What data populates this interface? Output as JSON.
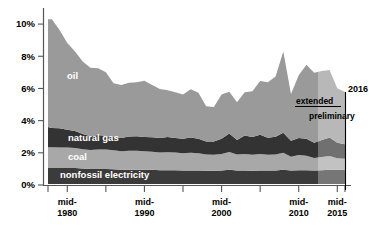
{
  "chart_data": {
    "type": "area",
    "stacked": true,
    "title": "",
    "subtitle": "",
    "xlabel": "",
    "ylabel": "",
    "grid": false,
    "legend_position": "inline-on-areas",
    "xlim": [
      1977.5,
      2016.0
    ],
    "ylim": [
      0,
      11.0
    ],
    "ytick_labels": [
      "0%",
      "2%",
      "4%",
      "6%",
      "8%",
      "10%"
    ],
    "ytick_values": [
      0,
      2,
      4,
      6,
      8,
      10
    ],
    "xtick_labels": [
      "mid-\n1980",
      "mid-\n1990",
      "mid-\n2000",
      "mid-\n2010",
      "mid-\n2015"
    ],
    "xtick_label_lines": [
      {
        "top": "mid-",
        "bottom": "1980",
        "value": 1980
      },
      {
        "top": "mid-",
        "bottom": "1990",
        "value": 1990
      },
      {
        "top": "mid-",
        "bottom": "2000",
        "value": 2000
      },
      {
        "top": "mid-",
        "bottom": "2010",
        "value": 2010
      },
      {
        "top": "mid-",
        "bottom": "2015",
        "value": 2015
      }
    ],
    "xtick_minor_values": [
      1977.5,
      1985,
      1995,
      2005,
      2016
    ],
    "x": [
      1977.5,
      1978,
      1979,
      1980,
      1981,
      1982,
      1983,
      1984,
      1985,
      1986,
      1987,
      1988,
      1989,
      1990,
      1991,
      1992,
      1993,
      1994,
      1995,
      1996,
      1997,
      1998,
      1999,
      2000,
      2001,
      2002,
      2003,
      2004,
      2005,
      2006,
      2007,
      2008,
      2009,
      2010,
      2011,
      2012,
      2013,
      2014,
      2015,
      2016
    ],
    "series": [
      {
        "name": "nonfossil electricity",
        "label": "nonfossil electricity",
        "color": "#3b3b3b",
        "values": [
          1.05,
          1.05,
          1.05,
          1.05,
          1.05,
          1.02,
          1.0,
          1.0,
          1.0,
          0.98,
          0.95,
          0.95,
          0.95,
          0.95,
          0.95,
          0.92,
          0.92,
          0.92,
          0.9,
          0.9,
          0.9,
          0.88,
          0.88,
          0.9,
          0.95,
          0.9,
          0.9,
          0.88,
          0.9,
          0.9,
          0.9,
          0.95,
          0.9,
          0.92,
          0.92,
          0.9,
          0.92,
          0.95,
          0.95,
          0.95
        ]
      },
      {
        "name": "coal",
        "label": "coal",
        "color": "#a8a8a8",
        "values": [
          1.3,
          1.3,
          1.28,
          1.28,
          1.25,
          1.2,
          1.18,
          1.2,
          1.2,
          1.18,
          1.15,
          1.18,
          1.18,
          1.15,
          1.12,
          1.1,
          1.12,
          1.1,
          1.08,
          1.1,
          1.08,
          1.02,
          1.0,
          1.02,
          1.1,
          1.0,
          1.02,
          1.0,
          1.02,
          0.98,
          1.0,
          1.05,
          0.85,
          0.95,
          0.9,
          0.78,
          0.82,
          0.85,
          0.72,
          0.68
        ]
      },
      {
        "name": "natural gas",
        "label": "natural gas",
        "color": "#333333",
        "values": [
          1.25,
          1.2,
          1.2,
          1.1,
          1.05,
          0.95,
          0.85,
          0.9,
          0.85,
          0.82,
          0.82,
          0.88,
          0.9,
          0.88,
          0.9,
          0.9,
          0.95,
          0.9,
          0.9,
          0.95,
          0.9,
          0.8,
          0.82,
          0.95,
          1.15,
          0.9,
          1.15,
          1.1,
          1.2,
          1.05,
          1.1,
          1.25,
          1.0,
          1.05,
          1.05,
          0.95,
          1.05,
          1.15,
          0.95,
          0.9
        ]
      },
      {
        "name": "oil",
        "label": "oil",
        "color": "#9a9a9a",
        "values": [
          6.7,
          6.75,
          6.1,
          5.4,
          4.95,
          4.5,
          4.25,
          4.15,
          3.95,
          3.35,
          3.3,
          3.35,
          3.35,
          3.5,
          3.25,
          3.05,
          2.9,
          2.85,
          2.75,
          3.0,
          2.85,
          2.2,
          2.15,
          2.75,
          2.6,
          2.35,
          2.7,
          2.85,
          3.35,
          3.45,
          3.75,
          5.05,
          2.9,
          3.9,
          4.6,
          4.35,
          4.3,
          4.2,
          3.4,
          3.25
        ]
      }
    ],
    "annotations": [
      {
        "name": "extended",
        "text": "extended",
        "x": 2012.5,
        "y": 5.3
      },
      {
        "name": "preliminary",
        "text": "preliminary",
        "x": 2013.5,
        "y": 4.6
      },
      {
        "name": "year-2016",
        "text": "2016",
        "x": 2016,
        "y": 6.2
      }
    ],
    "shaded_region": {
      "name": "preliminary-region",
      "from": 2012.5,
      "to": 2016,
      "note": "lighter overlay indicating extended / preliminary data"
    }
  },
  "colors": {
    "oil": "#9a9a9a",
    "natural_gas": "#333333",
    "coal": "#a8a8a8",
    "nonfossil_electricity": "#3b3b3b",
    "axis": "#555555",
    "background": "#ffffff",
    "label_text": "#ffffff"
  }
}
